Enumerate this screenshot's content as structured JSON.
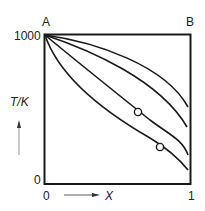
{
  "diagram": {
    "corner_labels": {
      "top_left": "A",
      "top_right": "B"
    },
    "y_axis": {
      "label": "T/K",
      "top_tick": "1000",
      "bottom_tick": "0"
    },
    "x_axis": {
      "label": "X",
      "left_tick": "0",
      "right_tick": "1"
    },
    "curves": [
      {
        "name": "curve-1",
        "end_y_fraction": 0.55
      },
      {
        "name": "curve-2",
        "end_y_fraction": 0.38
      },
      {
        "name": "curve-3",
        "end_y_fraction": 0.2
      },
      {
        "name": "curve-4",
        "end_y_fraction": 0.1
      }
    ],
    "markers": [
      {
        "name": "marker-circle-1",
        "on_curve": "curve-3"
      },
      {
        "name": "marker-circle-2",
        "on_curve": "curve-4"
      }
    ],
    "colors": {
      "line": "#1a1a1a",
      "background": "#ffffff"
    }
  }
}
